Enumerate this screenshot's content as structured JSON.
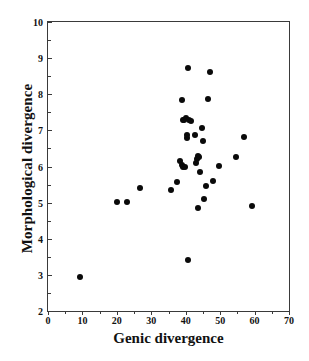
{
  "chart_data": {
    "type": "scatter",
    "title": "",
    "subtitle": "",
    "xlabel": "Genic divergence",
    "ylabel": "Morphological divergence",
    "xlim": [
      0,
      70
    ],
    "ylim": [
      2,
      10
    ],
    "xticks": [
      0,
      10,
      20,
      30,
      40,
      50,
      60,
      70
    ],
    "yticks": [
      2,
      3,
      4,
      5,
      6,
      7,
      8,
      9,
      10
    ],
    "xtick_labels": [
      "0",
      "10",
      "20",
      "30",
      "40",
      "50",
      "60",
      "70"
    ],
    "ytick_labels": [
      "2",
      "3",
      "4",
      "5",
      "6",
      "7",
      "8",
      "9",
      "10"
    ],
    "x_minor_step": 5,
    "y_minor_step": 0.5,
    "grid": false,
    "legend": null,
    "marker": "filled-circle",
    "marker_color": "#0a0a0a",
    "marker_size_px": 6,
    "annotations": [],
    "n_points": 38,
    "points": [
      {
        "x": 9.4,
        "y": 2.93
      },
      {
        "x": 19.9,
        "y": 5.01
      },
      {
        "x": 22.9,
        "y": 5.01
      },
      {
        "x": 26.6,
        "y": 5.4
      },
      {
        "x": 35.6,
        "y": 5.35
      },
      {
        "x": 37.6,
        "y": 5.57
      },
      {
        "x": 38.3,
        "y": 6.15
      },
      {
        "x": 38.8,
        "y": 7.85
      },
      {
        "x": 38.9,
        "y": 6.05
      },
      {
        "x": 39.2,
        "y": 7.28
      },
      {
        "x": 39.3,
        "y": 6.0
      },
      {
        "x": 39.6,
        "y": 7.3
      },
      {
        "x": 39.7,
        "y": 5.98
      },
      {
        "x": 40.2,
        "y": 7.33
      },
      {
        "x": 40.3,
        "y": 6.8
      },
      {
        "x": 40.4,
        "y": 6.88
      },
      {
        "x": 40.6,
        "y": 8.73
      },
      {
        "x": 40.8,
        "y": 3.41
      },
      {
        "x": 41.0,
        "y": 7.3
      },
      {
        "x": 41.4,
        "y": 7.27
      },
      {
        "x": 42.6,
        "y": 6.88
      },
      {
        "x": 43.0,
        "y": 6.1
      },
      {
        "x": 43.3,
        "y": 6.22
      },
      {
        "x": 43.5,
        "y": 6.3
      },
      {
        "x": 43.7,
        "y": 4.84
      },
      {
        "x": 43.9,
        "y": 6.25
      },
      {
        "x": 44.2,
        "y": 5.84
      },
      {
        "x": 44.6,
        "y": 7.07
      },
      {
        "x": 45.0,
        "y": 6.7
      },
      {
        "x": 45.3,
        "y": 5.1
      },
      {
        "x": 45.9,
        "y": 5.47
      },
      {
        "x": 46.6,
        "y": 7.88
      },
      {
        "x": 47.0,
        "y": 8.62
      },
      {
        "x": 48.0,
        "y": 5.6
      },
      {
        "x": 49.7,
        "y": 6.01
      },
      {
        "x": 54.5,
        "y": 6.27
      },
      {
        "x": 57.0,
        "y": 6.82
      },
      {
        "x": 59.2,
        "y": 4.92
      }
    ]
  }
}
